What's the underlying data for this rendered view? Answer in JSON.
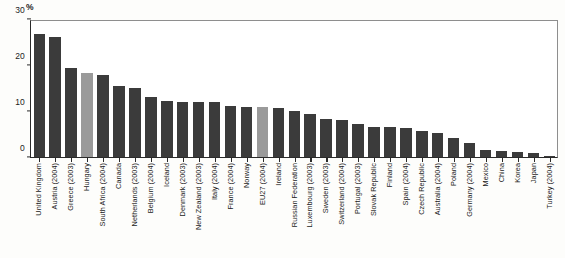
{
  "chart_data": {
    "type": "bar",
    "title": "",
    "subtitle": "",
    "xlabel": "",
    "ylabel": "",
    "unit_label": "%",
    "ylim": [
      0,
      30
    ],
    "yticks": [
      0,
      10,
      20,
      30
    ],
    "ytick_labels": [
      "0",
      "10",
      "20",
      "30"
    ],
    "grid": false,
    "legend": "none",
    "highlight_color": "#9a9a9a",
    "bar_color": "#3b3b3b",
    "highlighted_categories": [
      "Hungary",
      "EU27 (2004)"
    ],
    "categories": [
      "United Kingdom",
      "Austria (2004)",
      "Greece (2003)",
      "Hungary",
      "South Africa (2004)",
      "Canada",
      "Netherlands (2003)",
      "Belgium (2004)",
      "Iceland",
      "Denmark (2003)",
      "New Zealand (2003)",
      "Italy (2004)",
      "France (2004)",
      "Norway",
      "EU27 (2004)",
      "Ireland",
      "Russian Federation",
      "Luxembourg (2003)",
      "Sweden (2003)",
      "Switzerland (2004)",
      "Portugal (2003)",
      "Slovak Republic",
      "Finland",
      "Spain (2004)",
      "Czech Republic",
      "Australia (2004)",
      "Poland",
      "Germany (2004)",
      "Mexico",
      "China",
      "Korea",
      "Japan",
      "Turkey (2004)"
    ],
    "values": [
      27.0,
      26.2,
      19.4,
      18.3,
      17.9,
      15.6,
      15.0,
      13.2,
      12.2,
      12.1,
      12.1,
      11.9,
      11.1,
      11.0,
      10.9,
      10.7,
      10.0,
      9.3,
      8.3,
      8.1,
      7.2,
      6.6,
      6.5,
      6.4,
      5.7,
      5.1,
      4.0,
      3.1,
      1.5,
      1.2,
      1.1,
      0.9,
      0.2
    ]
  }
}
